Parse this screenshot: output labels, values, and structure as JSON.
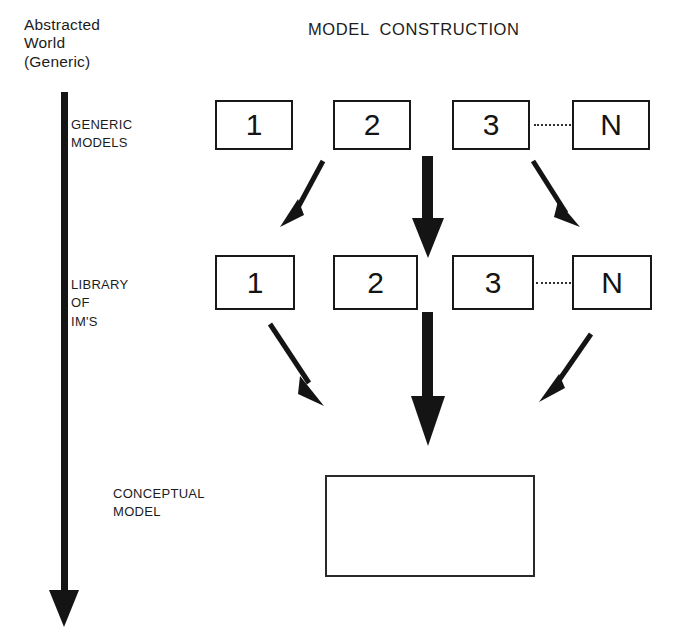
{
  "diagram": {
    "title": "MODEL  CONSTRUCTION",
    "axis_caption": "Abstracted\nWorld\n(Generic)",
    "axis_direction": "downward-arrow",
    "stages": [
      {
        "id": "generic-models",
        "label": "GENERIC\nMODELS"
      },
      {
        "id": "library-of-ims",
        "label": "LIBRARY\nOF\nIM'S"
      },
      {
        "id": "conceptual-model",
        "label": "CONCEPTUAL\nMODEL"
      }
    ],
    "rows": [
      {
        "id": "generic-models-row",
        "boxes": [
          {
            "label": "1"
          },
          {
            "label": "2"
          },
          {
            "label": "3"
          },
          {
            "label": "N"
          }
        ],
        "ellipsis_between": "3-N"
      },
      {
        "id": "library-of-ims-row",
        "boxes": [
          {
            "label": "1"
          },
          {
            "label": "2"
          },
          {
            "label": "3"
          },
          {
            "label": "N"
          }
        ],
        "ellipsis_between": "3-N"
      }
    ],
    "conceptual_model_box": {
      "label": ""
    },
    "arrows": [
      {
        "id": "generic-to-library-left",
        "style": "thin-diagonal",
        "direction": "down-left"
      },
      {
        "id": "generic-to-library-center",
        "style": "thick-vertical",
        "direction": "down"
      },
      {
        "id": "generic-to-library-right",
        "style": "thin-diagonal",
        "direction": "down-right"
      },
      {
        "id": "library-to-conceptual-left",
        "style": "thin-diagonal",
        "direction": "down-right"
      },
      {
        "id": "library-to-conceptual-center",
        "style": "thick-vertical",
        "direction": "down"
      },
      {
        "id": "library-to-conceptual-right",
        "style": "thin-diagonal",
        "direction": "down-left"
      }
    ],
    "colors": {
      "ink": "#1a1a1a",
      "box_border": "#181818",
      "background": "#ffffff"
    }
  }
}
